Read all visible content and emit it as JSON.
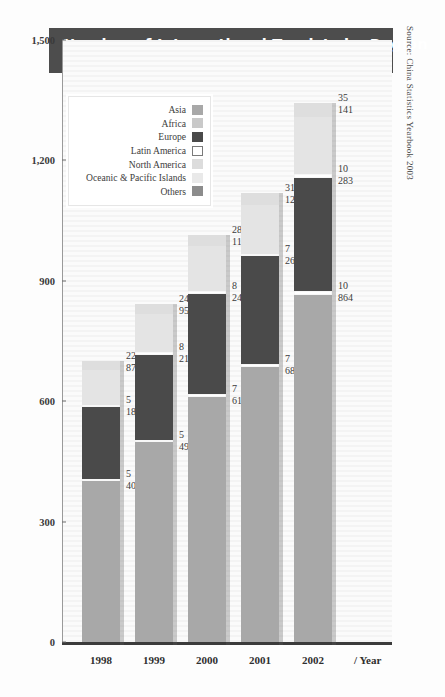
{
  "title": {
    "main": "Number of International Tourists by Region",
    "sub": "2002, in 10,000 persons"
  },
  "source": "Source: China Statistics Yearbook 2003",
  "x_unit": "/ Year",
  "legend": {
    "items": [
      {
        "label": "Asia",
        "color": "#a8a8a8"
      },
      {
        "label": "Africa",
        "color": "#c9c9c9"
      },
      {
        "label": "Europe",
        "color": "#4a4a4a"
      },
      {
        "label": "Latin America",
        "color": "#ffffff"
      },
      {
        "label": "North America",
        "color": "#dcdcdc"
      },
      {
        "label": "Oceanic & Pacific Islands",
        "color": "#e9e9e9"
      },
      {
        "label": "Others",
        "color": "#8c8c8c"
      }
    ]
  },
  "chart_data": {
    "type": "bar",
    "title": "Number of International Tourists by Region",
    "subtitle": "2002, in 10,000 persons",
    "xlabel": "/ Year",
    "ylabel": "",
    "ylim": [
      0,
      1500
    ],
    "yticks": [
      0,
      300,
      600,
      900,
      1200,
      1500
    ],
    "ytick_labels": [
      "0",
      "300",
      "600",
      "900",
      "1,200",
      "1,500"
    ],
    "grid": false,
    "stacked": true,
    "legend_position": "upper-left-inset",
    "categories": [
      "1998",
      "1999",
      "2000",
      "2001",
      "2002"
    ],
    "series": [
      {
        "name": "Asia",
        "color": "#a8a8a8",
        "values": [
          400,
          499,
          610,
          686,
          864
        ]
      },
      {
        "name": "Latin America",
        "color": "#ffffff",
        "values": [
          5,
          5,
          7,
          7,
          10
        ]
      },
      {
        "name": "Europe",
        "color": "#4a4a4a",
        "values": [
          181,
          211,
          249,
          268,
          283
        ]
      },
      {
        "name": "Others",
        "color": "#ffffff",
        "values": [
          5,
          8,
          8,
          7,
          10
        ]
      },
      {
        "name": "Upper",
        "color": "#e4e4e4",
        "values": [
          87,
          95,
          113,
          120,
          141
        ]
      },
      {
        "name": "Top",
        "color": "#dedede",
        "values": [
          22,
          24,
          28,
          31,
          35
        ]
      }
    ],
    "totals": [
      700,
      842,
      1015,
      1119,
      1343
    ],
    "bar_labels": [
      {
        "category": "1998",
        "pairs": [
          [
            "22",
            "87"
          ],
          [
            "5",
            "181"
          ],
          [
            "5",
            "400"
          ]
        ]
      },
      {
        "category": "1999",
        "pairs": [
          [
            "24",
            "95"
          ],
          [
            "8",
            "211"
          ],
          [
            "5",
            "499"
          ]
        ]
      },
      {
        "category": "2000",
        "pairs": [
          [
            "28",
            "113"
          ],
          [
            "8",
            "249"
          ],
          [
            "7",
            "610"
          ]
        ]
      },
      {
        "category": "2001",
        "pairs": [
          [
            "31",
            "120"
          ],
          [
            "7",
            "268"
          ],
          [
            "7",
            "686"
          ]
        ]
      },
      {
        "category": "2002",
        "pairs": [
          [
            "35",
            "141"
          ],
          [
            "10",
            "283"
          ],
          [
            "10",
            "864"
          ]
        ]
      }
    ]
  }
}
